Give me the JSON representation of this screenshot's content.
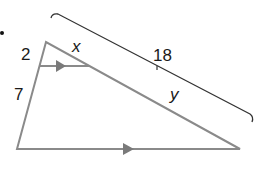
{
  "diagram": {
    "type": "geometry-triangle-side-splitter",
    "labels": {
      "upper_left_segment": "2",
      "lower_left_segment": "7",
      "upper_hypotenuse_segment": "x",
      "lower_hypotenuse_segment": "y",
      "hypotenuse_total": "18"
    },
    "markers": {
      "parallel_arrow_top": "parallel-arrow",
      "parallel_arrow_bottom": "parallel-arrow"
    },
    "colors": {
      "triangle_stroke": "#8a8a8a",
      "bracket_stroke": "#333333",
      "text": "#1a1a1a",
      "arrow_fill": "#7a7a7a"
    }
  }
}
